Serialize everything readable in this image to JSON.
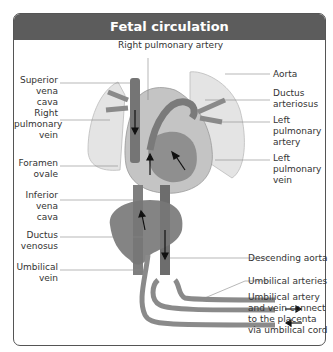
{
  "title": "Fetal circulation",
  "labels": {
    "right_pulmonary_artery": "Right pulmonary artery",
    "superior_vena_cava": [
      "Superior",
      "vena cava"
    ],
    "right_pulmonary_vein": [
      "Right",
      "pulmonary",
      "vein"
    ],
    "foramen_ovale": [
      "Foramen",
      "ovale"
    ],
    "inferior_vena_cava": [
      "Inferior",
      "vena cava"
    ],
    "ductus_venosus": [
      "Ductus",
      "venosus"
    ],
    "umbilical_vein": [
      "Umbilical",
      "vein"
    ],
    "aorta": "Aorta",
    "ductus_arteriosus": [
      "Ductus",
      "arteriosus"
    ],
    "left_pulmonary_artery": [
      "Left",
      "pulmonary",
      "artery"
    ],
    "left_pulmonary_vein": [
      "Left",
      "pulmonary",
      "vein"
    ],
    "descending_aorta": "Descending aorta",
    "umbilical_arteries": "Umbilical arteries",
    "placenta_note": [
      "Umbilical artery",
      "and vein connect",
      "to the placenta",
      "via umbilical cord"
    ]
  },
  "colors": {
    "header_bg": "#5c5c5c",
    "lung": "#e3e3e3",
    "heart_outer": "#c8c8c8",
    "vessel_dark": "#6e6e6e",
    "vessel_mid": "#8a8a8a",
    "liver": "#7a7a7a"
  }
}
